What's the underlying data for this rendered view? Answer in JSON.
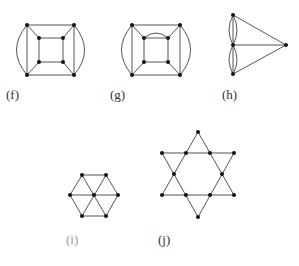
{
  "figures": [
    {
      "id": "f",
      "label": "(f)",
      "label_pos": [
        6,
        99
      ]
    },
    {
      "id": "g",
      "label": "(g)",
      "label_pos": [
        110,
        99
      ]
    },
    {
      "id": "h",
      "label": "(h)",
      "label_pos": [
        222,
        99
      ]
    },
    {
      "id": "i",
      "label": "(i)",
      "label_pos": [
        66,
        244
      ]
    },
    {
      "id": "j",
      "label": "(j)",
      "label_pos": [
        158,
        244
      ]
    }
  ],
  "colors": {
    "edge": "#555555",
    "node": "#111111",
    "label": "#333333",
    "label_light": "#999999"
  }
}
